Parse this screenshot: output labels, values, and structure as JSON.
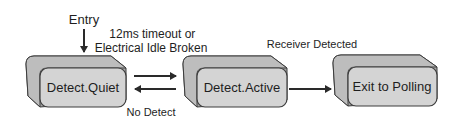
{
  "diagram": {
    "entry_label": "Entry",
    "transition_quiet_to_active": [
      "12ms timeout or",
      "Electrical Idle Broken"
    ],
    "transition_active_to_quiet": "No Detect",
    "transition_active_to_exit": "Receiver Detected",
    "states": [
      {
        "id": "detect-quiet",
        "label": "Detect.Quiet"
      },
      {
        "id": "detect-active",
        "label": "Detect.Active"
      },
      {
        "id": "exit-to-polling",
        "label": "Exit to Polling"
      }
    ],
    "colors": {
      "face": "#d4d4d4",
      "side": "#a6a6a6",
      "outline": "#3c3c3c",
      "arrow": "#2a2a2a"
    }
  }
}
